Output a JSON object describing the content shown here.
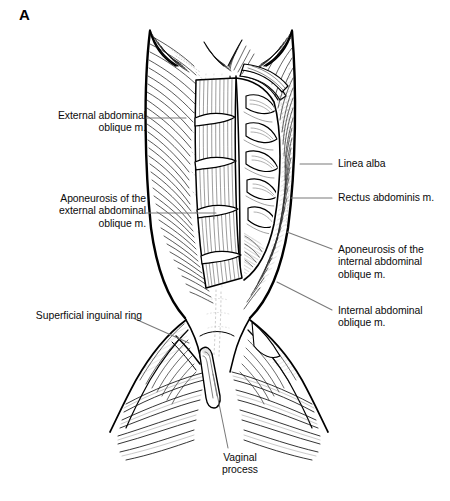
{
  "figure": {
    "panel_letter": "A",
    "background_color": "#ffffff",
    "ink_color": "#000000",
    "leader_line_color": "#7a7a7a"
  },
  "labels": [
    {
      "id": "external-abdominal-oblique",
      "text": "External abdominal\noblique m.",
      "align": "right",
      "side": "left",
      "leader": {
        "type": "straight",
        "from": [
          146,
          118
        ],
        "to": [
          186,
          118
        ]
      }
    },
    {
      "id": "aponeurosis-external-abdominal-oblique",
      "text": "Aponeurosis of the\nexternal abdominal\noblique m.",
      "align": "right",
      "side": "left",
      "leader": {
        "type": "straight",
        "from": [
          146,
          213
        ],
        "to": [
          216,
          213
        ]
      }
    },
    {
      "id": "superficial-inguinal-ring",
      "text": "Superficial inguinal ring",
      "align": "right",
      "side": "left",
      "leader": {
        "type": "straight",
        "from": [
          132,
          318
        ],
        "to": [
          188,
          342
        ]
      }
    },
    {
      "id": "linea-alba",
      "text": "Linea alba",
      "align": "left",
      "side": "right",
      "leader": {
        "type": "straight",
        "from": [
          332,
          164
        ],
        "to": [
          300,
          164
        ]
      }
    },
    {
      "id": "rectus-abdominis",
      "text": "Rectus abdominis m.",
      "align": "left",
      "side": "right",
      "leader": {
        "type": "straight",
        "from": [
          332,
          198
        ],
        "to": [
          292,
          198
        ]
      }
    },
    {
      "id": "aponeurosis-internal-abdominal-oblique",
      "text": "Aponeurosis of the\ninternal abdominal\noblique m.",
      "align": "left",
      "side": "right",
      "leader": {
        "type": "straight",
        "from": [
          332,
          249
        ],
        "to": [
          288,
          233
        ]
      }
    },
    {
      "id": "internal-abdominal-oblique",
      "text": "Internal abdominal\noblique m.",
      "align": "left",
      "side": "right",
      "leader": {
        "type": "straight",
        "from": [
          332,
          310
        ],
        "to": [
          278,
          283
        ]
      }
    },
    {
      "id": "vaginal-process",
      "text": "Vaginal\nprocess",
      "align": "center",
      "side": "bottom",
      "leader": {
        "type": "straight",
        "from": [
          228,
          448
        ],
        "to": [
          212,
          372
        ]
      }
    }
  ]
}
